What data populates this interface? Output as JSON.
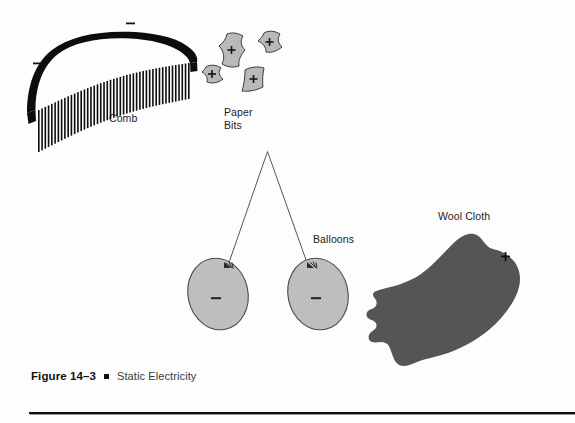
{
  "figure": {
    "caption_number": "Figure 14–3",
    "caption_title": "Static Electricity",
    "bullet_glyph": "▪"
  },
  "labels": {
    "comb": "Comb",
    "paper_bits_line1": "Paper",
    "paper_bits_line2": "Bits",
    "balloons": "Balloons",
    "wool_cloth": "Wool Cloth"
  },
  "charges": {
    "negative": "−",
    "positive": "+",
    "comb_negatives": [
      "−",
      "−"
    ],
    "paper_positives": [
      "+",
      "+",
      "+",
      "+"
    ],
    "balloon_negatives": [
      "−",
      "−"
    ],
    "wool_positives": [
      "+"
    ]
  },
  "colors": {
    "page_background": "#fdfdfd",
    "ink": "#111111",
    "comb_body": "#0d0d0d",
    "paper_fill": "#b9b9b9",
    "paper_stroke": "#3b3b3b",
    "balloon_fill": "#bebebe",
    "balloon_stroke": "#4a4a4a",
    "wool_fill": "#555555",
    "string_stroke": "#55555a",
    "caption_title": "#3a3a3a",
    "rule": "#0c0c0c"
  },
  "objects": {
    "comb": {
      "name": "Comb",
      "teeth_count": 47,
      "charge": "negative"
    },
    "paper_bits": {
      "name": "Paper Bits",
      "count": 4,
      "charge": "positive"
    },
    "balloons": {
      "name": "Balloons",
      "count": 2,
      "charge": "negative"
    },
    "wool_cloth": {
      "name": "Wool Cloth",
      "count": 1,
      "charge": "positive"
    }
  }
}
